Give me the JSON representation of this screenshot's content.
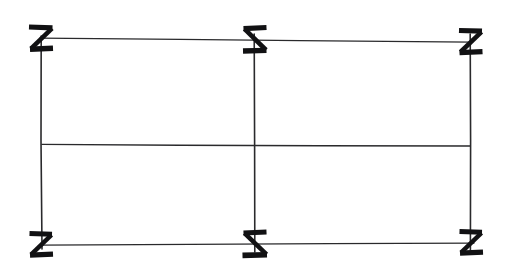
{
  "figure": {
    "media": "scanned ink drawing",
    "background_color": "#ffffff",
    "line_color": "#2a2a2c",
    "glyph_color": "#111113",
    "canvas": {
      "width": 510,
      "height": 269
    },
    "structure": {
      "outer_frame": "rectangle",
      "columns": 2,
      "rows": 2,
      "cells": 4
    },
    "lines": [
      {
        "name": "top-border",
        "orientation": "horizontal",
        "x1": 40,
        "y1": 38,
        "x2": 472,
        "y2": 42,
        "width": 1.3
      },
      {
        "name": "bottom-border",
        "orientation": "horizontal",
        "x1": 40,
        "y1": 245,
        "x2": 474,
        "y2": 243,
        "width": 1.3
      },
      {
        "name": "left-border",
        "orientation": "vertical",
        "x1": 41,
        "y1": 36,
        "x2": 42,
        "y2": 249,
        "width": 1.6
      },
      {
        "name": "right-border",
        "orientation": "vertical",
        "x1": 470,
        "y1": 34,
        "x2": 471,
        "y2": 250,
        "width": 1.6
      },
      {
        "name": "center-divider",
        "orientation": "vertical",
        "x1": 254,
        "y1": 34,
        "x2": 255,
        "y2": 252,
        "width": 1.6
      },
      {
        "name": "middle-divider",
        "orientation": "horizontal",
        "x1": 42,
        "y1": 144,
        "x2": 470,
        "y2": 146,
        "width": 1.5
      }
    ],
    "marks": [
      {
        "name": "mark-top-left",
        "glyph": "Z",
        "shape": "z",
        "x": 40,
        "y": 38,
        "scale": 1.0
      },
      {
        "name": "mark-top-center",
        "glyph": "S",
        "shape": "z-reversed",
        "x": 254,
        "y": 40,
        "scale": 1.0
      },
      {
        "name": "mark-top-right",
        "glyph": "Z",
        "shape": "z",
        "x": 470,
        "y": 42,
        "scale": 1.0
      },
      {
        "name": "mark-bottom-left",
        "glyph": "Z",
        "shape": "z",
        "x": 40,
        "y": 245,
        "scale": 1.0
      },
      {
        "name": "mark-bottom-center",
        "glyph": "S",
        "shape": "z-reversed",
        "x": 254,
        "y": 244,
        "scale": 1.0
      },
      {
        "name": "mark-bottom-right",
        "glyph": "Z",
        "shape": "z",
        "x": 470,
        "y": 243,
        "scale": 1.0
      }
    ],
    "mark_count": 6,
    "labels": [],
    "caption": ""
  }
}
